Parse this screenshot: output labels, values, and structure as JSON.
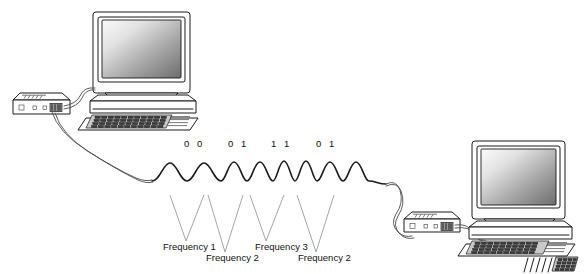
{
  "diagram": {
    "colors": {
      "outline": "#1a1a1a",
      "wave": "#1a1a1a",
      "leader": "#8d8d8d",
      "cable": "#4a4a4a",
      "screen_light": "#f2f2f2",
      "screen_dark": "#6f6f6f",
      "background": "#ffffff"
    },
    "bit_labels": [
      {
        "text": "0 0",
        "x": 184,
        "y": 139
      },
      {
        "text": "0 1",
        "x": 228,
        "y": 139
      },
      {
        "text": "1 1",
        "x": 271,
        "y": 139
      },
      {
        "text": "0 1",
        "x": 316,
        "y": 139
      }
    ],
    "frequency_labels": [
      {
        "text": "Frequency 1",
        "x": 163,
        "y": 248
      },
      {
        "text": "Frequency 2",
        "x": 206,
        "y": 259
      },
      {
        "text": "Frequency 3",
        "x": 255,
        "y": 248
      },
      {
        "text": "Frequency 2",
        "x": 300,
        "y": 259
      }
    ],
    "nodes": [
      {
        "name": "left-computer",
        "role": "sending workstation"
      },
      {
        "name": "left-modem",
        "role": "sending modem"
      },
      {
        "name": "right-modem",
        "role": "receiving modem"
      },
      {
        "name": "right-computer",
        "role": "receiving workstation"
      }
    ],
    "waveform": {
      "description": "Frequency shift keyed carrier with four dibit symbol groups",
      "symbol_count": 4,
      "baseline_y": 178
    }
  }
}
